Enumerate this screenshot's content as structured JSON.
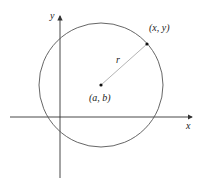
{
  "diagram": {
    "title": "",
    "axes": {
      "x_label": "x",
      "y_label": "y",
      "color": "#333333"
    },
    "circle": {
      "center_label": "(a, b)",
      "point_label": "(x, y)",
      "radius_label": "r",
      "stroke_color": "#555555"
    },
    "geometry": {
      "origin": [
        60,
        117
      ],
      "center": [
        101,
        85
      ],
      "radius_px": 62,
      "point": [
        147,
        44
      ]
    }
  }
}
